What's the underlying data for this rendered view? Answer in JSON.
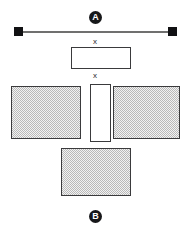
{
  "diagram": {
    "background_color": "#ffffff",
    "labels": {
      "top_badge": "A",
      "bottom_badge": "B",
      "gap_label_upper": "x",
      "gap_label_lower": "x"
    },
    "colors": {
      "badge_fill": "#17181a",
      "badge_text": "#ffffff",
      "outline": "#3a3a3c",
      "dimension_line": "#70706f",
      "dimension_cap": "#111113",
      "hatch_light": "#f2f2f2",
      "hatch_dark": "#b9b9b9",
      "open_box_fill": "#ffffff"
    },
    "elements": [
      {
        "name": "top-section-badge",
        "kind": "circled-letter",
        "text": "A",
        "x": 89,
        "y": 11,
        "size": 13
      },
      {
        "name": "dimension-line",
        "kind": "line-with-square-ends",
        "x": 18,
        "y": 31,
        "width": 155,
        "cap_size": 9
      },
      {
        "name": "gap-dimension-upper",
        "kind": "text",
        "text": "x",
        "x": 90,
        "y": 39
      },
      {
        "name": "upper-open-box",
        "kind": "open-rectangle",
        "x": 71,
        "y": 47,
        "width": 60,
        "height": 22
      },
      {
        "name": "gap-dimension-lower",
        "kind": "text",
        "text": "x",
        "x": 90,
        "y": 73
      },
      {
        "name": "left-hatched-block",
        "kind": "hatched-rectangle",
        "x": 11,
        "y": 86,
        "width": 70,
        "height": 53
      },
      {
        "name": "center-open-channel",
        "kind": "open-rectangle",
        "x": 90,
        "y": 84,
        "width": 21,
        "height": 58
      },
      {
        "name": "right-hatched-block",
        "kind": "hatched-rectangle",
        "x": 113,
        "y": 86,
        "width": 67,
        "height": 53
      },
      {
        "name": "bottom-hatched-block",
        "kind": "hatched-rectangle",
        "x": 61,
        "y": 148,
        "width": 70,
        "height": 48
      },
      {
        "name": "bottom-section-badge",
        "kind": "circled-letter",
        "text": "B",
        "x": 89,
        "y": 210,
        "size": 13
      }
    ]
  }
}
